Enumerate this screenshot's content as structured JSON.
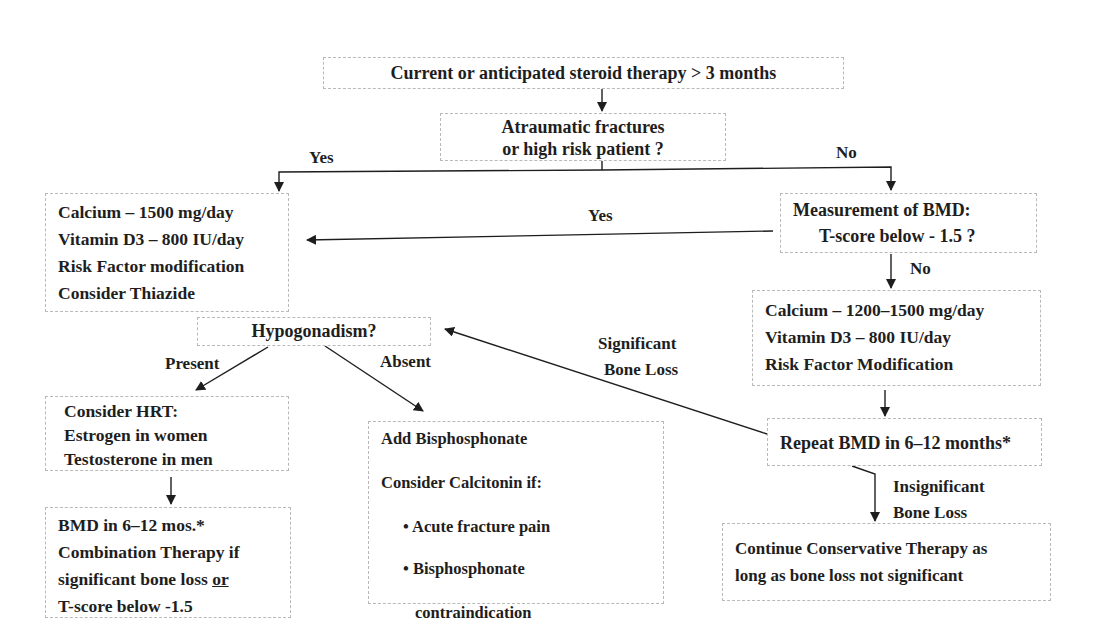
{
  "diagram": {
    "nodes": {
      "start": {
        "text": "Current or anticipated steroid therapy > 3 months"
      },
      "risk_question": {
        "lines": [
          "Atraumatic fractures",
          "or  high risk patient ?"
        ]
      },
      "high_risk_treatment": {
        "lines": [
          "Calcium – 1500 mg/day",
          "Vitamin D3 – 800 IU/day",
          "Risk Factor  modification",
          "Consider Thiazide"
        ]
      },
      "bmd_question": {
        "lines": [
          "Measurement of BMD:",
          "T-score below - 1.5 ?"
        ]
      },
      "low_risk_treatment": {
        "lines": [
          "Calcium – 1200–1500 mg/day",
          "Vitamin D3 – 800 IU/day",
          "Risk Factor  Modification"
        ]
      },
      "hypogonadism_question": {
        "text": "Hypogonadism?"
      },
      "hrt": {
        "lines": [
          "Consider HRT:",
          "Estrogen in women",
          "Testosterone in men"
        ]
      },
      "followup_bmd": {
        "line1": "BMD in 6–12 mos.*",
        "line2": "Combination Therapy if",
        "line3_pre": "significant  bone loss ",
        "line3_underlined": "or",
        "line4": "T-score below -1.5"
      },
      "bisphosphonate": {
        "line1": "Add Bisphosphonate",
        "line2": "Consider Calcitonin if:",
        "bullets": [
          "Acute fracture pain",
          "Bisphosphonate",
          "contraindication"
        ]
      },
      "repeat_bmd": {
        "text": "Repeat BMD in 6–12 months*"
      },
      "continue_therapy": {
        "lines": [
          "Continue Conservative Therapy as",
          "long as bone loss not significant"
        ]
      }
    },
    "edge_labels": {
      "yes_risk": "Yes",
      "no_risk": "No",
      "yes_bmd": "Yes",
      "no_bmd": "No",
      "present": "Present",
      "absent": "Absent",
      "significant": [
        "Significant",
        "Bone Loss"
      ],
      "insignificant": [
        "Insignificant",
        "Bone Loss"
      ]
    },
    "bullet_glyph": "•"
  }
}
